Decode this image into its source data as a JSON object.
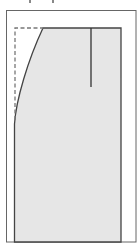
{
  "diagram": {
    "type": "pattern-piece",
    "colors": {
      "background": "#ffffff",
      "outline": "#555555",
      "fill": "#e6e6e6",
      "dashed": "#777777",
      "marker": "#333333"
    },
    "outer_frame": {
      "x": 6,
      "y": 10,
      "width": 130,
      "height": 232
    },
    "shape": {
      "top_left_curve_start": {
        "x": 43,
        "y": 28
      },
      "top_right": {
        "x": 121,
        "y": 28
      },
      "bottom_right": {
        "x": 121,
        "y": 242
      },
      "bottom_left": {
        "x": 14,
        "y": 242
      },
      "curve_end": {
        "x": 15,
        "y": 122
      }
    },
    "dashed_guide": {
      "x": 15,
      "top_y": 28,
      "bottom_y": 120,
      "right_x": 43
    },
    "vertical_marker": {
      "x": 91,
      "top_y": 28,
      "bottom_y": 87
    }
  }
}
